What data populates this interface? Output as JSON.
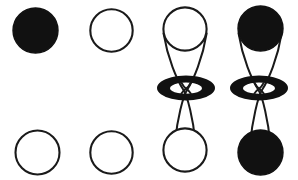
{
  "figure": {
    "name": "orbital-phase-diagram",
    "width": 298,
    "height": 180,
    "background_color": "#ffffff",
    "stroke_color": "#1a1a1a",
    "fill_color": "#111111",
    "stroke_width": 1.6
  },
  "columns": [
    {
      "id": "column-1",
      "type": "sphere-pair",
      "center_x": 35.5,
      "radius": 22.5,
      "top": {
        "name": "orbital-lobe-col1-top",
        "shape": "circle",
        "cx": 35.5,
        "cy": 30.5,
        "r": 22.5,
        "fill": "solid",
        "phase": "filled"
      },
      "bottom": {
        "name": "orbital-lobe-col1-bottom",
        "shape": "circle",
        "cx": 37.5,
        "cy": 152.5,
        "r": 22.5,
        "fill": "none",
        "phase": "empty"
      }
    },
    {
      "id": "column-2",
      "type": "sphere-pair",
      "center_x": 111.5,
      "radius": 21.5,
      "top": {
        "name": "orbital-lobe-col2-top",
        "shape": "circle",
        "cx": 111.5,
        "cy": 30.5,
        "r": 21.5,
        "fill": "none",
        "phase": "empty"
      },
      "bottom": {
        "name": "orbital-lobe-col2-bottom",
        "shape": "circle",
        "cx": 111.5,
        "cy": 152.5,
        "r": 21.5,
        "fill": "none",
        "phase": "empty"
      }
    },
    {
      "id": "column-3",
      "type": "dz2-orbital",
      "center_x": 185,
      "radius": 22,
      "top": {
        "name": "orbital-lobe-col3-top",
        "shape": "circle",
        "cx": 185,
        "cy": 29,
        "r": 22,
        "fill": "none",
        "phase": "empty"
      },
      "bottom": {
        "name": "orbital-lobe-col3-bottom",
        "shape": "circle",
        "cx": 185,
        "cy": 150,
        "r": 22,
        "fill": "none",
        "phase": "empty"
      },
      "torus": {
        "name": "orbital-torus-col3",
        "shape": "ellipse-ring",
        "cx": 186,
        "cy": 88,
        "rx": 29,
        "ry": 12.5,
        "hole_rx": 16,
        "hole_ry": 5.5,
        "fill": "solid"
      },
      "cones": {
        "name": "orbital-cone-col3",
        "top_half_width": 22,
        "bottom_half_width": 22,
        "waist_half_width": 5
      }
    },
    {
      "id": "column-4",
      "type": "dz2-orbital",
      "center_x": 260,
      "radius": 22.5,
      "top": {
        "name": "orbital-lobe-col4-top",
        "shape": "circle",
        "cx": 260.5,
        "cy": 28.5,
        "r": 22.5,
        "fill": "solid",
        "phase": "filled"
      },
      "bottom": {
        "name": "orbital-lobe-col4-bottom",
        "shape": "circle",
        "cx": 260.5,
        "cy": 152.5,
        "r": 22.5,
        "fill": "solid",
        "phase": "filled"
      },
      "torus": {
        "name": "orbital-torus-col4",
        "shape": "ellipse-ring",
        "cx": 259,
        "cy": 88,
        "rx": 29,
        "ry": 12.5,
        "hole_rx": 16,
        "hole_ry": 5.5,
        "fill": "solid"
      },
      "cones": {
        "name": "orbital-cone-col4",
        "top_half_width": 22,
        "bottom_half_width": 22,
        "waist_half_width": 5
      }
    }
  ]
}
